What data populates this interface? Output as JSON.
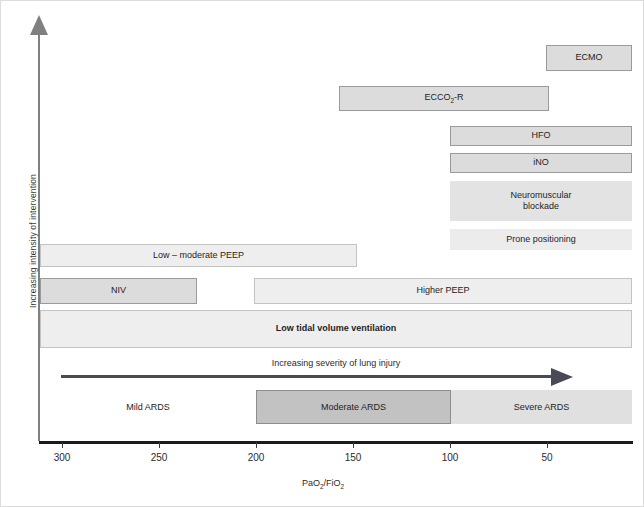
{
  "figure": {
    "width": 644,
    "height": 507,
    "background": "#ffffff",
    "border_color": "#dcdcdc"
  },
  "axes": {
    "y_title": "Increasing intensity of intervention",
    "x_title_html": "PaO2/FiO2",
    "x_title_parts": {
      "pre": "PaO",
      "sub1": "2",
      "mid": "/FiO",
      "sub2": "2"
    },
    "x_ticks": [
      300,
      250,
      200,
      150,
      100,
      50
    ],
    "x_tick_px": [
      61,
      158,
      255,
      352,
      449,
      546
    ],
    "axis_color": "#1a1a1a",
    "y_axis_color": "#808080"
  },
  "severity": {
    "label": "Increasing severity of lung injury",
    "arrow_color": "#4a4a56"
  },
  "chart_data": {
    "type": "bar",
    "xlabel": "PaO2/FiO2",
    "ylabel": "Increasing intensity of intervention",
    "xlim": [
      320,
      20
    ],
    "x_reversed": true,
    "grid": false,
    "legend": "none",
    "orientation": "horizontal",
    "note": "Each bar is a treatment spanning a PaO2/FiO2 range; vertical order encodes increasing intensity of intervention (top = most intensive).",
    "bars": [
      {
        "label": "ECMO",
        "x_start": 70,
        "x_end": 21,
        "row": 0,
        "style": "outlined",
        "bold": false,
        "px": {
          "left": 545,
          "top": 44,
          "width": 86,
          "height": 26
        }
      },
      {
        "label": "ECCO2-R",
        "x_start": 175,
        "x_end": 70,
        "row": 1,
        "style": "outlined",
        "bold": false,
        "px": {
          "left": 338,
          "top": 85,
          "width": 210,
          "height": 25
        }
      },
      {
        "label": "HFO",
        "x_start": 120,
        "x_end": 21,
        "row": 2,
        "style": "outlined",
        "bold": false,
        "px": {
          "left": 449,
          "top": 125,
          "width": 182,
          "height": 20
        }
      },
      {
        "label": "iNO",
        "x_start": 120,
        "x_end": 21,
        "row": 3,
        "style": "outlined",
        "bold": false,
        "px": {
          "left": 449,
          "top": 152,
          "width": 182,
          "height": 20
        }
      },
      {
        "label": "Neuromuscular\nblockade",
        "x_start": 120,
        "x_end": 21,
        "row": 4,
        "style": "flat",
        "bold": false,
        "px": {
          "left": 449,
          "top": 180,
          "width": 182,
          "height": 40
        }
      },
      {
        "label": "Prone positioning",
        "x_start": 120,
        "x_end": 21,
        "row": 5,
        "style": "flat-light",
        "bold": false,
        "px": {
          "left": 449,
          "top": 228,
          "width": 182,
          "height": 21
        }
      },
      {
        "label": "Low – moderate PEEP",
        "x_start": 308,
        "x_end": 150,
        "row": 6,
        "style": "light-outlined",
        "bold": false,
        "px": {
          "left": 39,
          "top": 243,
          "width": 317,
          "height": 23
        }
      },
      {
        "label": "NIV",
        "x_start": 308,
        "x_end": 227,
        "row": 7,
        "style": "outlined",
        "bold": false,
        "px": {
          "left": 39,
          "top": 277,
          "width": 157,
          "height": 26
        }
      },
      {
        "label": "Higher PEEP",
        "x_start": 201,
        "x_end": 21,
        "row": 7,
        "style": "light-outlined",
        "bold": false,
        "px": {
          "left": 253,
          "top": 277,
          "width": 378,
          "height": 26
        }
      },
      {
        "label": "Low tidal volume ventilation",
        "x_start": 308,
        "x_end": 21,
        "row": 8,
        "style": "light-outlined",
        "bold": true,
        "px": {
          "left": 39,
          "top": 309,
          "width": 592,
          "height": 38
        }
      }
    ],
    "severity_bands": [
      {
        "label": "Mild ARDS",
        "x_start": 300,
        "x_end": 200,
        "fill": "#ffffff",
        "px": {
          "left": 39,
          "top": 389,
          "width": 216,
          "height": 34
        }
      },
      {
        "label": "Moderate ARDS",
        "x_start": 200,
        "x_end": 100,
        "fill": "#c2c2c2",
        "px": {
          "left": 255,
          "top": 389,
          "width": 195,
          "height": 34
        }
      },
      {
        "label": "Severe ARDS",
        "x_start": 100,
        "x_end": 21,
        "fill": "#e0e0e0",
        "px": {
          "left": 450,
          "top": 389,
          "width": 181,
          "height": 34
        }
      }
    ],
    "colors": {
      "bar_outlined_fill": "#dcdcdc",
      "bar_outlined_border": "#9a9a9a",
      "bar_light_fill": "#eeeeee",
      "bar_light_border": "#c3c3c3",
      "bar_flat_fill": "#e3e3e3",
      "moderate_band": "#c2c2c2",
      "severe_band": "#e0e0e0"
    }
  }
}
